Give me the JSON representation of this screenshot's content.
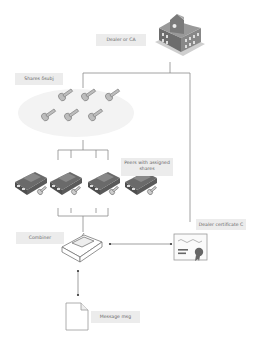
{
  "diagram": {
    "type": "secret-sharing architecture",
    "nodes": {
      "dealer": {
        "label": "Dealer or CA",
        "icon": "building-icon"
      },
      "shares": {
        "label": "Shares $\\delta_{j}$",
        "display": "Shares δsubj",
        "icon": "key-icon",
        "count": 6
      },
      "peers": {
        "label": "Peers with assigned shares",
        "icon": "car-icon",
        "count": 4
      },
      "combiner": {
        "label": "Combiner",
        "icon": "car-icon"
      },
      "certificate": {
        "label": "Dealer certificate C",
        "icon": "certificate-icon"
      },
      "message": {
        "label": "Message msg",
        "icon": "document-icon"
      }
    },
    "edges": [
      {
        "from": "dealer",
        "to": "shares"
      },
      {
        "from": "dealer",
        "to": "certificate"
      },
      {
        "from": "shares",
        "to": "peers"
      },
      {
        "from": "peers",
        "to": "combiner"
      },
      {
        "from": "combiner",
        "to": "certificate",
        "style": "dotted-arrow"
      },
      {
        "from": "combiner",
        "to": "message",
        "style": "dotted-arrow"
      }
    ],
    "colors": {
      "label_bg": "#ececec",
      "line": "#888888",
      "icon_dark": "#555555",
      "cloud": "#f2f2f2"
    }
  },
  "labels": {
    "dealer": "Dealer or CA",
    "shares": "Shares δsubj",
    "peers_line1": "Peers with assigned",
    "peers_line2": "shares",
    "combiner": "Combiner",
    "certificate": "Dealer certificate C",
    "message": "Message msg"
  }
}
